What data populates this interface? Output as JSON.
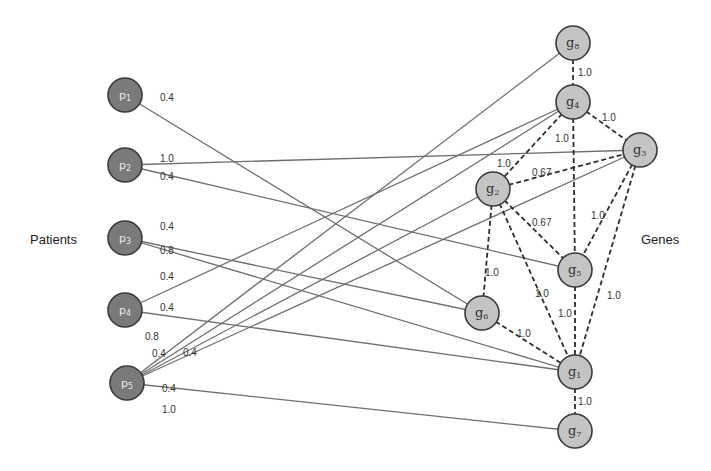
{
  "labels": {
    "patients": "Patients",
    "genes": "Genes"
  },
  "nodes": {
    "p1": {
      "name": "p",
      "sub": "1",
      "x": 125,
      "y": 95
    },
    "p2": {
      "name": "p",
      "sub": "2",
      "x": 125,
      "y": 165
    },
    "p3": {
      "name": "p",
      "sub": "3",
      "x": 125,
      "y": 238
    },
    "p4": {
      "name": "p",
      "sub": "4",
      "x": 125,
      "y": 310
    },
    "p5": {
      "name": "p",
      "sub": "5",
      "x": 127,
      "y": 383
    },
    "g1": {
      "name": "g",
      "sub": "1",
      "x": 575,
      "y": 372
    },
    "g2": {
      "name": "g",
      "sub": "2",
      "x": 493,
      "y": 189
    },
    "g3": {
      "name": "g",
      "sub": "3",
      "x": 640,
      "y": 150
    },
    "g4": {
      "name": "g",
      "sub": "4",
      "x": 573,
      "y": 102
    },
    "g5": {
      "name": "g",
      "sub": "5",
      "x": 575,
      "y": 270
    },
    "g6": {
      "name": "g",
      "sub": "6",
      "x": 482,
      "y": 313
    },
    "g7": {
      "name": "g",
      "sub": "7",
      "x": 575,
      "y": 431
    },
    "g8": {
      "name": "g",
      "sub": "8",
      "x": 573,
      "y": 43
    }
  },
  "edges": {
    "patient_gene": [
      {
        "from": "p1",
        "to": "g6",
        "weight": "0.4",
        "lx": 160,
        "ly": 101
      },
      {
        "from": "p2",
        "to": "g3",
        "weight": "1.0",
        "lx": 160,
        "ly": 162
      },
      {
        "from": "p2",
        "to": "g5",
        "weight": "0.4",
        "lx": 160,
        "ly": 180
      },
      {
        "from": "p3",
        "to": "g1",
        "weight": "0.4",
        "lx": 160,
        "ly": 230
      },
      {
        "from": "p3",
        "to": "g6",
        "weight": "0.8",
        "lx": 160,
        "ly": 254
      },
      {
        "from": "p4",
        "to": "g4",
        "weight": "0.4",
        "lx": 160,
        "ly": 280
      },
      {
        "from": "p4",
        "to": "g1",
        "weight": "0.4",
        "lx": 160,
        "ly": 311
      },
      {
        "from": "p5",
        "to": "g8",
        "weight": "0.8",
        "lx": 145,
        "ly": 340
      },
      {
        "from": "p5",
        "to": "g4",
        "weight": "0.4",
        "lx": 152,
        "ly": 357
      },
      {
        "from": "p5",
        "to": "g2",
        "weight": "0.4",
        "lx": 183,
        "ly": 356
      },
      {
        "from": "p5",
        "to": "g3",
        "weight": "0.4",
        "lx": 162,
        "ly": 392
      },
      {
        "from": "p5",
        "to": "g7",
        "weight": "1.0",
        "lx": 162,
        "ly": 413
      }
    ],
    "gene_gene": [
      {
        "from": "g8",
        "to": "g4",
        "weight": "1.0",
        "lx": 578,
        "ly": 76
      },
      {
        "from": "g4",
        "to": "g3",
        "weight": "1.0",
        "lx": 602,
        "ly": 121
      },
      {
        "from": "g4",
        "to": "g5",
        "weight": "1.0",
        "lx": 555,
        "ly": 142
      },
      {
        "from": "g4",
        "to": "g2",
        "weight": "1.0",
        "lx": 497,
        "ly": 167
      },
      {
        "from": "g2",
        "to": "g3",
        "weight": "0.67",
        "lx": 532,
        "ly": 176
      },
      {
        "from": "g2",
        "to": "g5",
        "weight": "0.67",
        "lx": 532,
        "ly": 226
      },
      {
        "from": "g3",
        "to": "g5",
        "weight": "1.0",
        "lx": 591,
        "ly": 219
      },
      {
        "from": "g3",
        "to": "g1",
        "weight": "1.0",
        "lx": 607,
        "ly": 299
      },
      {
        "from": "g2",
        "to": "g6",
        "weight": "1.0",
        "lx": 485,
        "ly": 276
      },
      {
        "from": "g2",
        "to": "g1",
        "weight": "1.0",
        "lx": 535,
        "ly": 297
      },
      {
        "from": "g5",
        "to": "g1",
        "weight": "1.0",
        "lx": 558,
        "ly": 317
      },
      {
        "from": "g6",
        "to": "g1",
        "weight": "1.0",
        "lx": 517,
        "ly": 337
      },
      {
        "from": "g1",
        "to": "g7",
        "weight": "1.0",
        "lx": 578,
        "ly": 405
      }
    ]
  }
}
